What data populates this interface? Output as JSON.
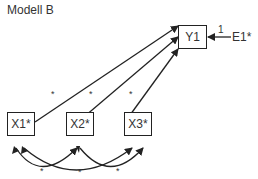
{
  "title": "Modell B",
  "nodes": {
    "y1": "Y1",
    "e1": "E1*",
    "x1": "X1*",
    "x2": "X2*",
    "x3": "X3*"
  },
  "paths": {
    "e1_to_y1_label": "1",
    "x1_to_y1_label": "*",
    "x2_to_y1_label": "*",
    "x3_to_y1_label": "*",
    "cov_x1_x2_label": "*",
    "cov_x1_x3_label": "*",
    "cov_x2_x3_label": "*"
  }
}
